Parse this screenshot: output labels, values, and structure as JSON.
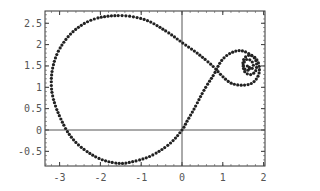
{
  "chart_data": {
    "type": "scatter",
    "title": "",
    "xlabel": "",
    "ylabel": "",
    "xlim": [
      -3.35,
      2.05
    ],
    "ylim": [
      -0.85,
      2.8
    ],
    "grid": false,
    "legend": null,
    "x_ticks": [
      -3,
      -2,
      -1,
      0,
      1,
      2
    ],
    "x_tick_labels": [
      "-3",
      "-2",
      "-1",
      "0",
      "1",
      "2"
    ],
    "y_ticks": [
      -0.5,
      0,
      0.5,
      1,
      1.5,
      2,
      2.5
    ],
    "y_tick_labels": [
      "-0.5",
      "0",
      "0.5",
      "1",
      "1.5",
      "2",
      "2.5"
    ],
    "axes_lines": {
      "x": 0,
      "y": 0
    },
    "marker": {
      "style": "dot",
      "color": "#222222",
      "size": 1.6
    },
    "series": [
      {
        "name": "parametric-curve-main",
        "points": [
          [
            1.6,
            1.5
          ],
          [
            1.68,
            1.42
          ],
          [
            1.75,
            1.5
          ],
          [
            1.7,
            1.62
          ],
          [
            1.58,
            1.65
          ],
          [
            1.5,
            1.52
          ],
          [
            1.55,
            1.35
          ],
          [
            1.7,
            1.3
          ],
          [
            1.82,
            1.42
          ],
          [
            1.8,
            1.65
          ],
          [
            1.62,
            1.8
          ],
          [
            1.4,
            1.86
          ],
          [
            1.15,
            1.78
          ],
          [
            0.95,
            1.6
          ],
          [
            0.78,
            1.3
          ],
          [
            0.55,
            0.95
          ],
          [
            0.3,
            0.5
          ],
          [
            0.12,
            0.2
          ],
          [
            0.0,
            0.0
          ],
          [
            -0.3,
            -0.32
          ],
          [
            -0.75,
            -0.6
          ],
          [
            -1.2,
            -0.74
          ],
          [
            -1.55,
            -0.78
          ],
          [
            -2.0,
            -0.68
          ],
          [
            -2.45,
            -0.42
          ],
          [
            -2.75,
            -0.12
          ],
          [
            -2.95,
            0.22
          ],
          [
            -3.12,
            0.62
          ],
          [
            -3.2,
            1.0
          ],
          [
            -3.17,
            1.45
          ],
          [
            -3.0,
            1.9
          ],
          [
            -2.65,
            2.32
          ],
          [
            -2.15,
            2.6
          ],
          [
            -1.5,
            2.68
          ],
          [
            -0.9,
            2.58
          ],
          [
            -0.4,
            2.32
          ],
          [
            0.0,
            2.05
          ],
          [
            0.4,
            1.78
          ],
          [
            0.75,
            1.5
          ],
          [
            1.0,
            1.25
          ],
          [
            1.2,
            1.1
          ],
          [
            1.45,
            1.05
          ],
          [
            1.72,
            1.1
          ],
          [
            1.88,
            1.3
          ],
          [
            1.88,
            1.55
          ],
          [
            1.76,
            1.72
          ],
          [
            1.6,
            1.74
          ],
          [
            1.5,
            1.62
          ],
          [
            1.52,
            1.45
          ],
          [
            1.62,
            1.4
          ],
          [
            1.66,
            1.5
          ]
        ]
      }
    ]
  }
}
